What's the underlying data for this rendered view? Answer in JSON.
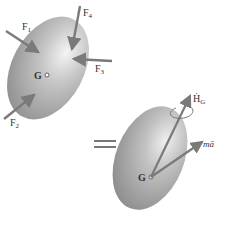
{
  "diagram": {
    "type": "rigid body free-body / kinetic diagram",
    "left_body": {
      "center_label": "G",
      "forces": [
        {
          "label": "F",
          "sub": "1"
        },
        {
          "label": "F",
          "sub": "2"
        },
        {
          "label": "F",
          "sub": "3"
        },
        {
          "label": "F",
          "sub": "4"
        }
      ]
    },
    "equals_sign": "=",
    "right_body": {
      "center_label": "G",
      "angular_momentum_rate": {
        "label": "Ḣ",
        "sub": "G"
      },
      "linear_term": {
        "label": "mā"
      }
    },
    "colors": {
      "body_fill": "#9a9a9a",
      "body_highlight": "#f2f2f2",
      "arrow": "#7a7a7a",
      "text": "#333333"
    }
  }
}
